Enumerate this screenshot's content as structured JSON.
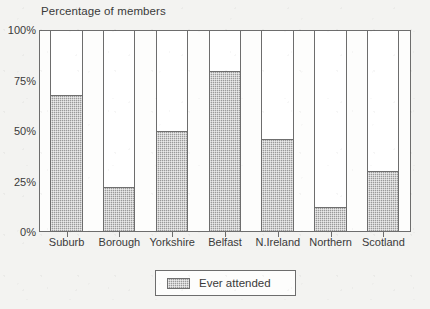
{
  "chart_data": {
    "type": "bar",
    "title": "Percentage of members",
    "xlabel": "",
    "ylabel": "",
    "ylim": [
      0,
      100
    ],
    "yticks": [
      "0%",
      "25%",
      "50%",
      "75%",
      "100%"
    ],
    "ytick_values": [
      0,
      25,
      50,
      75,
      100
    ],
    "grid": false,
    "legend_position": "bottom-center",
    "categories": [
      "Suburb",
      "Borough",
      "Yorkshire",
      "Belfast",
      "N.Ireland",
      "Northern",
      "Scotland"
    ],
    "series": [
      {
        "name": "Ever attended",
        "values": [
          68,
          22,
          50,
          80,
          46,
          12,
          30
        ],
        "color": "#9a9a9a"
      }
    ],
    "note": "Each category column is drawn full height to 100%; the shaded portion shows the 'Ever attended' percentage."
  },
  "legend": {
    "items": [
      {
        "label": "Ever attended",
        "swatch_name": "legend-swatch-ever-attended"
      }
    ]
  },
  "axis": {
    "y_tick_labels": [
      "100%",
      "75%",
      "50%",
      "25%",
      "0%"
    ]
  }
}
